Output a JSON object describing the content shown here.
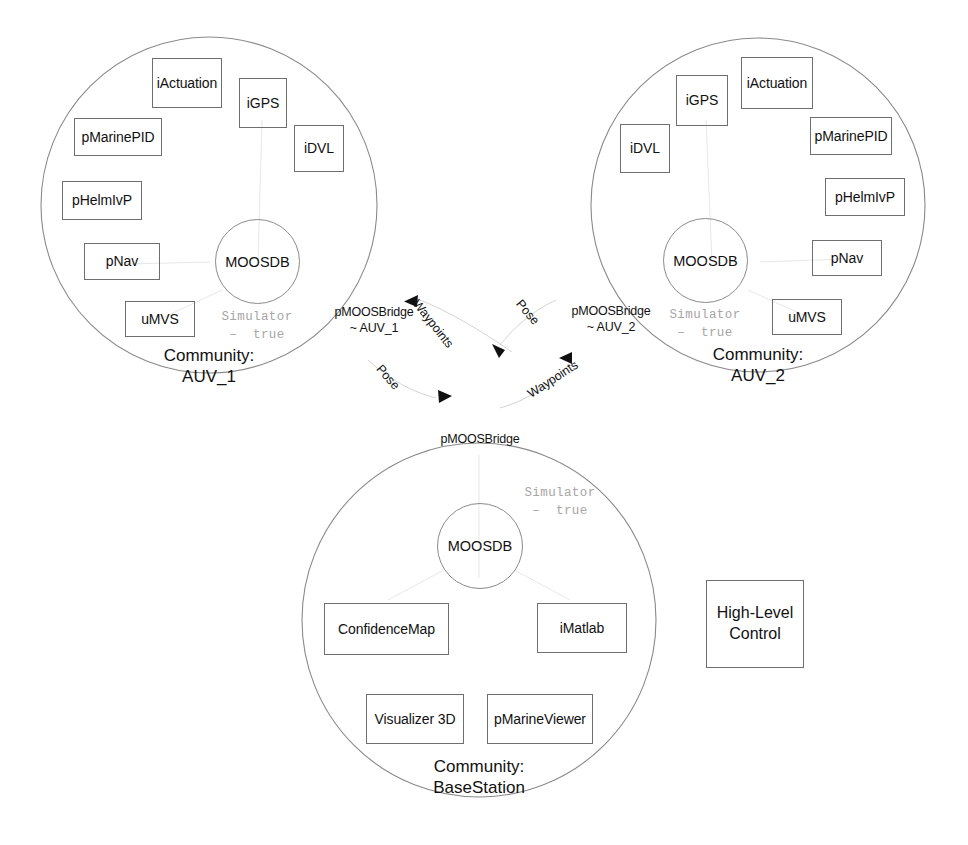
{
  "diagram": {
    "stroke_color": "#6e6e6e",
    "circle_color": "#8a8a8a",
    "sim_text_color": "#a6a6a6",
    "text_color": "#111111"
  },
  "communities": [
    {
      "id": "auv1",
      "label": "Community:\nAUV_1",
      "db": "MOOSDB",
      "sim": "Simulator\n–  true",
      "bridge": "pMOOSBridge\n~ AUV_1",
      "modules": [
        {
          "name": "iActuation",
          "label": "iActuation"
        },
        {
          "name": "iGPS",
          "label": "iGPS"
        },
        {
          "name": "iDVL",
          "label": "iDVL"
        },
        {
          "name": "pMarinePID",
          "label": "pMarinePID"
        },
        {
          "name": "pHelmIvP",
          "label": "pHelmIvP"
        },
        {
          "name": "pNav",
          "label": "pNav"
        },
        {
          "name": "uMVS",
          "label": "uMVS"
        }
      ]
    },
    {
      "id": "auv2",
      "label": "Community:\nAUV_2",
      "db": "MOOSDB",
      "sim": "Simulator\n–  true",
      "bridge": "pMOOSBridge\n~ AUV_2",
      "modules": [
        {
          "name": "iActuation",
          "label": "iActuation"
        },
        {
          "name": "iGPS",
          "label": "iGPS"
        },
        {
          "name": "iDVL",
          "label": "iDVL"
        },
        {
          "name": "pMarinePID",
          "label": "pMarinePID"
        },
        {
          "name": "pHelmIvP",
          "label": "pHelmIvP"
        },
        {
          "name": "pNav",
          "label": "pNav"
        },
        {
          "name": "uMVS",
          "label": "uMVS"
        }
      ]
    },
    {
      "id": "basestation",
      "label": "Community:\nBaseStation",
      "db": "MOOSDB",
      "sim": "Simulator\n–  true",
      "bridge": "pMOOSBridge",
      "modules": [
        {
          "name": "ConfidenceMap",
          "label": "ConfidenceMap"
        },
        {
          "name": "iMatlab",
          "label": "iMatlab"
        },
        {
          "name": "Visualizer3D",
          "label": "Visualizer 3D"
        },
        {
          "name": "pMarineViewer",
          "label": "pMarineViewer"
        }
      ]
    }
  ],
  "external": {
    "high_level_control": "High-Level\nControl"
  },
  "flows": [
    {
      "id": "waypoints-to-auv1",
      "label": "Waypoints"
    },
    {
      "id": "pose-from-auv2",
      "label": "Pose"
    },
    {
      "id": "pose-to-auv2",
      "label": "Pose"
    },
    {
      "id": "waypoints-to-auv2",
      "label": "Waypoints"
    }
  ]
}
